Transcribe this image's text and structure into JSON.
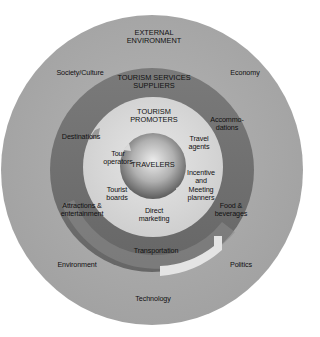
{
  "colors": {
    "background": "#ffffff",
    "outer_ring": "#a9a9a9",
    "middle_ring": "#6f6f6f",
    "inner_ring": "#d9d9d9",
    "sphere_light": "#e4e4e4",
    "sphere_dark": "#6a6a6a",
    "text": "#111111"
  },
  "layers": {
    "outer": {
      "title": "EXTERNAL\nENVIRONMENT",
      "items": [
        "Society/Culture",
        "Economy",
        "Environment",
        "Politics",
        "Technology"
      ]
    },
    "middle": {
      "title": "TOURISM SERVICES\nSUPPLIERS",
      "items": [
        "Destinations",
        "Accommo-\ndations",
        "Attractions &\nentertainment",
        "Food &\nbeverages",
        "Transportation"
      ]
    },
    "inner": {
      "title": "TOURISM\nPROMOTERS",
      "items": [
        "Tour\noperators",
        "Travel\nagents",
        "Tourist\nboards",
        "Incentive\nand\nMeeting\nplanners",
        "Direct\nmarketing"
      ]
    },
    "core": {
      "title": "TRAVELERS"
    }
  }
}
